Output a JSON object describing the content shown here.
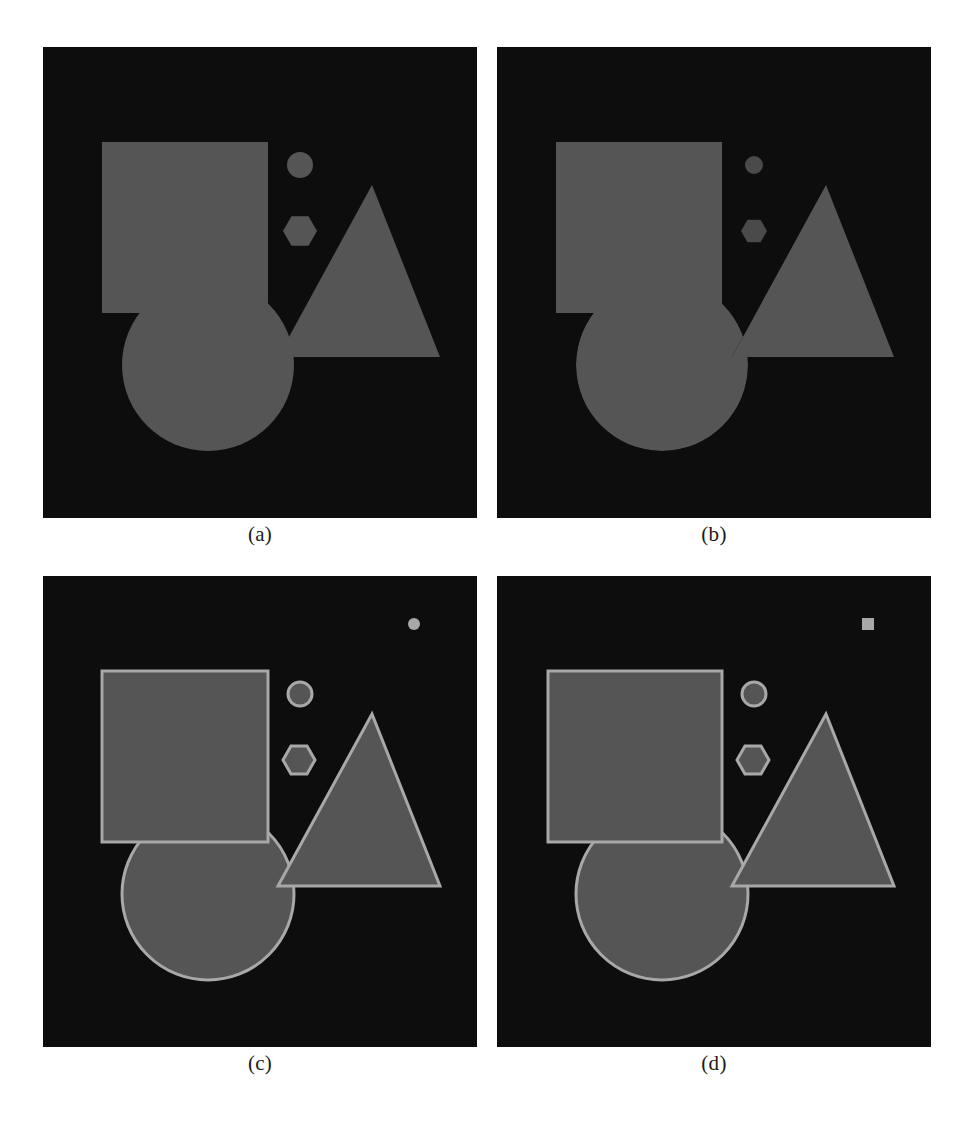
{
  "figure": {
    "type": "multi-panel-geometric-shape-figure",
    "panel_count": 4,
    "layout": "2x2 grid",
    "background_color": "#ffffff"
  },
  "colors": {
    "page_background": "#ffffff",
    "panel_background": "#0d0d0d",
    "shape_fill": "#555555",
    "shape_outline": "#a8a8a8",
    "caption_text": "#1a1a1a"
  },
  "panels": [
    {
      "id": "a",
      "caption": "(a)",
      "description": "Filled gray shapes on black background, no outlines, full overlap ordering",
      "has_outlines": false,
      "occlusion": "layered",
      "extra_marker": "none",
      "shapes": [
        {
          "name": "square",
          "fill": true,
          "outline": false
        },
        {
          "name": "circle",
          "fill": true,
          "outline": false
        },
        {
          "name": "triangle",
          "fill": true,
          "outline": false
        },
        {
          "name": "small-circle",
          "fill": true,
          "outline": false
        },
        {
          "name": "hexagon",
          "fill": true,
          "outline": false
        }
      ]
    },
    {
      "id": "b",
      "caption": "(b)",
      "description": "Filled gray shapes with occluded regions removed, small markers dimmed",
      "has_outlines": false,
      "occlusion": "cut-out",
      "extra_marker": "none",
      "shapes": [
        {
          "name": "square",
          "fill": true,
          "outline": false
        },
        {
          "name": "circle",
          "fill": true,
          "outline": false
        },
        {
          "name": "triangle",
          "fill": true,
          "outline": false
        },
        {
          "name": "small-circle",
          "fill": true,
          "outline": false
        },
        {
          "name": "hexagon",
          "fill": true,
          "outline": false
        }
      ]
    },
    {
      "id": "c",
      "caption": "(c)",
      "description": "Filled gray shapes with light outlines, plus a small filled circle marker top-right",
      "has_outlines": true,
      "occlusion": "layered",
      "extra_marker": "small-circle",
      "shapes": [
        {
          "name": "square",
          "fill": true,
          "outline": true
        },
        {
          "name": "circle",
          "fill": true,
          "outline": true
        },
        {
          "name": "triangle",
          "fill": true,
          "outline": true
        },
        {
          "name": "small-circle",
          "fill": true,
          "outline": true
        },
        {
          "name": "hexagon",
          "fill": true,
          "outline": true
        },
        {
          "name": "marker-dot",
          "fill": true,
          "outline": false
        }
      ]
    },
    {
      "id": "d",
      "caption": "(d)",
      "description": "Filled gray shapes with light outlines, plus a small filled square marker top-right",
      "has_outlines": true,
      "occlusion": "layered",
      "extra_marker": "small-square",
      "shapes": [
        {
          "name": "square",
          "fill": true,
          "outline": true
        },
        {
          "name": "circle",
          "fill": true,
          "outline": true
        },
        {
          "name": "triangle",
          "fill": true,
          "outline": true
        },
        {
          "name": "small-circle",
          "fill": true,
          "outline": true
        },
        {
          "name": "hexagon",
          "fill": true,
          "outline": true
        },
        {
          "name": "marker-square",
          "fill": true,
          "outline": false
        }
      ]
    }
  ],
  "geometry": {
    "panel_size": [
      434,
      471
    ],
    "square": {
      "x": 59,
      "y": 95,
      "width": 166,
      "height": 171
    },
    "circle": {
      "cx": 165,
      "cy": 318,
      "r": 86
    },
    "triangle": {
      "apex": [
        329,
        138
      ],
      "left": [
        235,
        310
      ],
      "right": [
        397,
        310
      ]
    },
    "small_circle": {
      "cx": 257,
      "cy": 118,
      "r": 13
    },
    "hexagon": {
      "cx": 257,
      "cy": 184,
      "r": 17
    },
    "marker": {
      "cx": 371,
      "cy": 68,
      "r": 7
    }
  }
}
